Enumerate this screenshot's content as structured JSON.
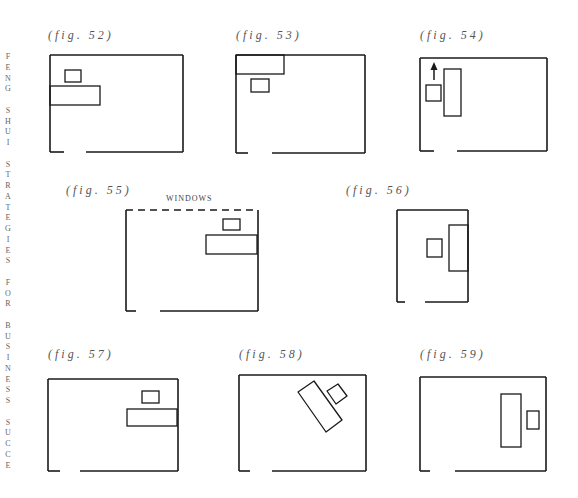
{
  "side_text": "FENG SHUI STRATEGIES FOR BUSINESS SUCCE",
  "figures": [
    {
      "id": "52",
      "caption": "(fig. 52)",
      "cap_x": 48,
      "cap_y": 28,
      "room": {
        "x": 50,
        "y": 55,
        "w": 133,
        "h": 97,
        "door": [
          64,
          86
        ],
        "dashed_top": false
      },
      "items": [
        {
          "type": "rect",
          "x": 65,
          "y": 70,
          "w": 16,
          "h": 12
        },
        {
          "type": "rect",
          "x": 50,
          "y": 86,
          "w": 50,
          "h": 19
        }
      ]
    },
    {
      "id": "53",
      "caption": "(fig. 53)",
      "cap_x": 236,
      "cap_y": 28,
      "room": {
        "x": 236,
        "y": 55,
        "w": 129,
        "h": 98,
        "door": [
          248,
          272
        ],
        "dashed_top": false
      },
      "items": [
        {
          "type": "rect",
          "x": 236,
          "y": 55,
          "w": 48,
          "h": 19
        },
        {
          "type": "rect",
          "x": 251,
          "y": 79,
          "w": 18,
          "h": 13
        }
      ]
    },
    {
      "id": "54",
      "caption": "(fig. 54)",
      "cap_x": 420,
      "cap_y": 28,
      "room": {
        "x": 420,
        "y": 58,
        "w": 127,
        "h": 93,
        "door": [
          434,
          457
        ],
        "dashed_top": false
      },
      "items": [
        {
          "type": "rect",
          "x": 426,
          "y": 85,
          "w": 15,
          "h": 16
        },
        {
          "type": "rect",
          "x": 444,
          "y": 69,
          "w": 17,
          "h": 47
        },
        {
          "type": "arrow",
          "x": 434,
          "y1": 80,
          "y2": 62
        }
      ]
    },
    {
      "id": "55",
      "caption": "(fig. 55)",
      "cap_x": 66,
      "cap_y": 183,
      "room": {
        "x": 126,
        "y": 210,
        "w": 132,
        "h": 101,
        "door": [
          136,
          160
        ],
        "dashed_top": true
      },
      "label": {
        "text": "WINDOWS",
        "x": 166,
        "y": 194
      },
      "items": [
        {
          "type": "rect",
          "x": 223,
          "y": 219,
          "w": 17,
          "h": 11
        },
        {
          "type": "rect",
          "x": 206,
          "y": 235,
          "w": 51,
          "h": 19
        }
      ]
    },
    {
      "id": "56",
      "caption": "(fig. 56)",
      "cap_x": 346,
      "cap_y": 183,
      "room": {
        "x": 397,
        "y": 210,
        "w": 71,
        "h": 92,
        "door": [
          405,
          425
        ],
        "dashed_top": false
      },
      "items": [
        {
          "type": "rect",
          "x": 427,
          "y": 239,
          "w": 15,
          "h": 18
        },
        {
          "type": "rect",
          "x": 449,
          "y": 225,
          "w": 19,
          "h": 46
        }
      ]
    },
    {
      "id": "57",
      "caption": "(fig. 57)",
      "cap_x": 48,
      "cap_y": 347,
      "room": {
        "x": 48,
        "y": 379,
        "w": 130,
        "h": 92,
        "door": [
          60,
          80
        ],
        "dashed_top": false
      },
      "items": [
        {
          "type": "rect",
          "x": 142,
          "y": 391,
          "w": 17,
          "h": 12
        },
        {
          "type": "rect",
          "x": 127,
          "y": 409,
          "w": 50,
          "h": 17
        }
      ]
    },
    {
      "id": "58",
      "caption": "(fig. 58)",
      "cap_x": 239,
      "cap_y": 347,
      "room": {
        "x": 239,
        "y": 375,
        "w": 127,
        "h": 96,
        "door": [
          250,
          272
        ],
        "dashed_top": false
      },
      "items": [
        {
          "type": "poly",
          "points": "298,392 314,381 342,420 326,432"
        },
        {
          "type": "poly",
          "points": "327,391 338,384 347,396 336,404"
        }
      ]
    },
    {
      "id": "59",
      "caption": "(fig. 59)",
      "cap_x": 420,
      "cap_y": 347,
      "room": {
        "x": 420,
        "y": 377,
        "w": 126,
        "h": 94,
        "door": [
          430,
          455
        ],
        "dashed_top": false
      },
      "items": [
        {
          "type": "rect",
          "x": 501,
          "y": 394,
          "w": 20,
          "h": 53
        },
        {
          "type": "rect",
          "x": 527,
          "y": 411,
          "w": 12,
          "h": 18
        }
      ]
    }
  ]
}
